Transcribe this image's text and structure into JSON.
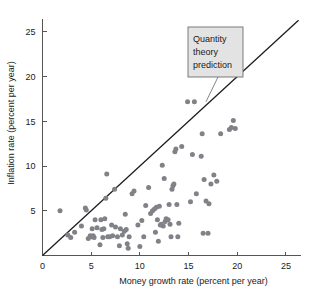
{
  "chart_data": {
    "type": "scatter",
    "title": "",
    "xlabel": "Money growth rate (percent per year)",
    "ylabel": "Inflation rate (percent per year)",
    "xlim": [
      0,
      26.5
    ],
    "ylim": [
      0,
      26.5
    ],
    "xticks": [
      0,
      5,
      10,
      15,
      20,
      25
    ],
    "yticks": [
      5,
      10,
      15,
      20,
      25
    ],
    "xticklabels": [
      "0",
      "5",
      "10",
      "15",
      "20",
      "25"
    ],
    "yticklabels": [
      "5",
      "10",
      "15",
      "20",
      "25"
    ],
    "grid": false,
    "legend": false,
    "point_color": "#808288",
    "line_color": "#1a1a1a",
    "annotations": [
      {
        "name": "quantity-theory-prediction",
        "lines": [
          "Quantity",
          "theory",
          "prediction"
        ],
        "text": "Quantity theory prediction",
        "box_fill": "#e3e3e3",
        "box_stroke": "#6d6d6d",
        "points_to_x": 16.8,
        "points_to_y": 17.2
      }
    ],
    "reference_line": {
      "name": "quantity-theory-prediction-line",
      "description": "45 degree line: inflation equals money growth",
      "slope": 1,
      "intercept": 0,
      "x_start": 0,
      "x_end": 26.3
    },
    "series": [
      {
        "name": "countries",
        "points": [
          [
            1.8,
            5.0
          ],
          [
            2.6,
            2.3
          ],
          [
            2.9,
            2.0
          ],
          [
            3.3,
            2.6
          ],
          [
            4.0,
            3.3
          ],
          [
            4.4,
            5.3
          ],
          [
            4.5,
            5.1
          ],
          [
            4.7,
            1.9
          ],
          [
            4.9,
            2.2
          ],
          [
            5.0,
            2.1
          ],
          [
            5.1,
            3.0
          ],
          [
            5.2,
            2.2
          ],
          [
            5.3,
            2.0
          ],
          [
            5.4,
            4.0
          ],
          [
            5.6,
            3.1
          ],
          [
            5.9,
            1.2
          ],
          [
            6.0,
            4.0
          ],
          [
            6.1,
            2.9
          ],
          [
            6.2,
            2.0
          ],
          [
            6.3,
            3.0
          ],
          [
            6.4,
            4.1
          ],
          [
            6.5,
            6.4
          ],
          [
            6.6,
            9.1
          ],
          [
            6.7,
            2.1
          ],
          [
            6.9,
            2.1
          ],
          [
            7.1,
            3.4
          ],
          [
            7.2,
            2.2
          ],
          [
            7.4,
            7.4
          ],
          [
            7.5,
            3.2
          ],
          [
            7.7,
            2.1
          ],
          [
            7.9,
            1.1
          ],
          [
            8.0,
            3.0
          ],
          [
            8.2,
            2.3
          ],
          [
            8.4,
            2.7
          ],
          [
            8.5,
            4.6
          ],
          [
            8.6,
            2.9
          ],
          [
            8.7,
            1.3
          ],
          [
            8.8,
            0.8
          ],
          [
            8.9,
            2.1
          ],
          [
            9.2,
            6.9
          ],
          [
            9.4,
            7.2
          ],
          [
            9.8,
            3.4
          ],
          [
            10.0,
            1.0
          ],
          [
            10.2,
            3.9
          ],
          [
            10.4,
            2.1
          ],
          [
            10.6,
            5.6
          ],
          [
            10.9,
            7.6
          ],
          [
            11.1,
            4.7
          ],
          [
            11.3,
            5.0
          ],
          [
            11.5,
            5.2
          ],
          [
            11.6,
            2.6
          ],
          [
            11.7,
            5.4
          ],
          [
            11.8,
            4.0
          ],
          [
            11.9,
            1.6
          ],
          [
            12.0,
            5.5
          ],
          [
            12.1,
            3.4
          ],
          [
            12.2,
            3.5
          ],
          [
            12.3,
            10.1
          ],
          [
            12.4,
            3.3
          ],
          [
            12.5,
            8.6
          ],
          [
            12.6,
            3.8
          ],
          [
            12.7,
            4.1
          ],
          [
            12.9,
            4.0
          ],
          [
            13.0,
            5.7
          ],
          [
            13.1,
            3.5
          ],
          [
            13.2,
            2.1
          ],
          [
            13.3,
            7.4
          ],
          [
            13.4,
            7.8
          ],
          [
            13.5,
            8.0
          ],
          [
            13.6,
            11.6
          ],
          [
            13.7,
            11.9
          ],
          [
            13.8,
            5.7
          ],
          [
            13.9,
            2.1
          ],
          [
            14.0,
            3.6
          ],
          [
            14.3,
            12.2
          ],
          [
            14.9,
            17.2
          ],
          [
            15.2,
            6.0
          ],
          [
            15.4,
            11.3
          ],
          [
            15.6,
            17.2
          ],
          [
            15.8,
            6.9
          ],
          [
            16.3,
            11.1
          ],
          [
            16.4,
            13.6
          ],
          [
            16.5,
            2.5
          ],
          [
            16.6,
            8.5
          ],
          [
            16.8,
            6.1
          ],
          [
            17.0,
            2.5
          ],
          [
            17.1,
            5.8
          ],
          [
            17.3,
            8.0
          ],
          [
            17.6,
            9.0
          ],
          [
            17.9,
            8.3
          ],
          [
            18.3,
            13.6
          ],
          [
            19.2,
            14.1
          ],
          [
            19.4,
            14.3
          ],
          [
            19.6,
            15.1
          ],
          [
            19.8,
            14.2
          ]
        ]
      }
    ]
  }
}
